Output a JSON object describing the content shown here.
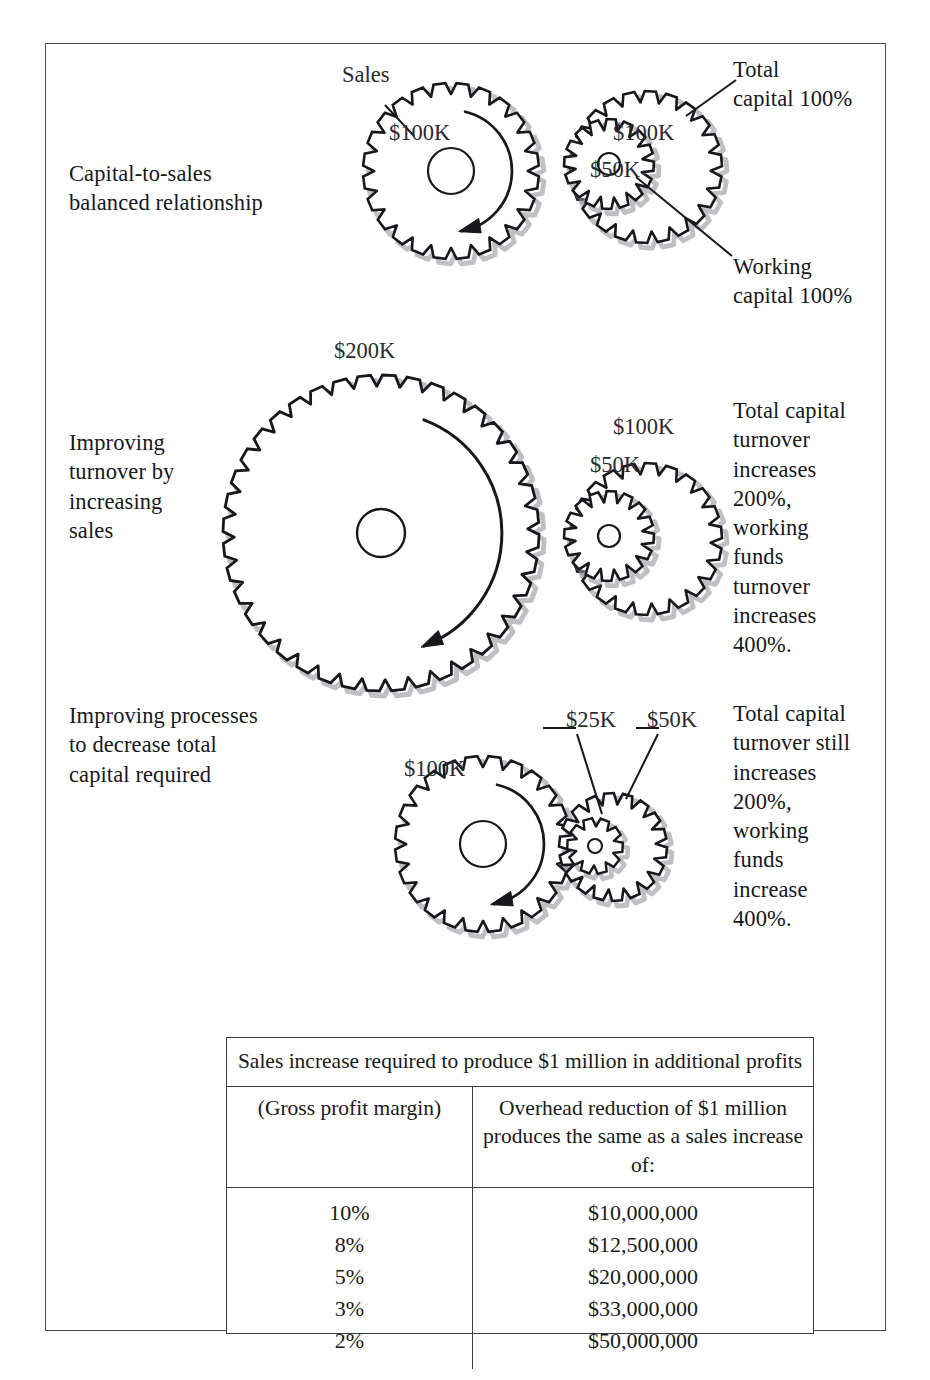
{
  "diagram": {
    "rows": [
      {
        "id": "row1",
        "label": "Capital-to-sales\nbalanced relationship",
        "side_note": "",
        "gear_labels": {
          "sales": "Sales",
          "big": "$100K",
          "mid": "$100K",
          "small": "$50K"
        },
        "callouts": {
          "total_capital": "Total\ncapital 100%",
          "working_capital": "Working\ncapital 100%"
        }
      },
      {
        "id": "row2",
        "label": "Improving\nturnover by\nincreasing\nsales",
        "side_note": "Total capital\nturnover\nincreases\n200%,\nworking\nfunds\nturnover\nincreases\n400%.",
        "gear_labels": {
          "big": "$200K",
          "mid": "$100K",
          "small": "$50K"
        }
      },
      {
        "id": "row3",
        "label": "Improving processes\nto decrease total\ncapital required",
        "side_note": "Total capital\nturnover still\nincreases\n200%,\nworking\nfunds\nincrease\n400%.",
        "gear_labels": {
          "big": "$100K",
          "mid": "$50K",
          "small": "$25K"
        }
      }
    ]
  },
  "table": {
    "title": "Sales increase required to produce $1 million\nin additional profits",
    "headers": {
      "left": "(Gross profit margin)",
      "right": "Overhead reduction of\n$1 million produces the same\nas a sales increase of:"
    },
    "rows": [
      {
        "margin": "10%",
        "amount": "$10,000,000"
      },
      {
        "margin": "8%",
        "amount": "$12,500,000"
      },
      {
        "margin": "5%",
        "amount": "$20,000,000"
      },
      {
        "margin": "3%",
        "amount": "$33,000,000"
      },
      {
        "margin": "2%",
        "amount": "$50,000,000"
      }
    ]
  },
  "chart_data": {
    "type": "table",
    "title": "Sales increase required to produce $1 million in additional profits",
    "categories": [
      "10%",
      "8%",
      "5%",
      "3%",
      "2%"
    ],
    "values": [
      10000000,
      12500000,
      20000000,
      33000000,
      50000000
    ],
    "xlabel": "(Gross profit margin)",
    "ylabel": "Overhead reduction of $1 million produces the same as a sales increase of:"
  },
  "colors": {
    "ink": "#17171c",
    "frame": "#4a4a52",
    "shadow": "#8c8c94",
    "paper": "#ffffff"
  }
}
